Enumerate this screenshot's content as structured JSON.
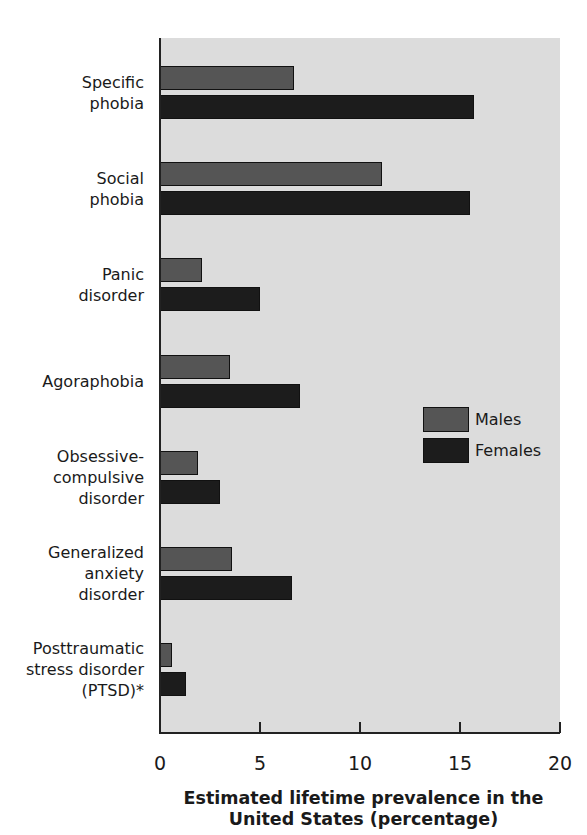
{
  "chart_data": {
    "type": "bar",
    "orientation": "horizontal",
    "title": "",
    "categories": [
      "Specific phobia",
      "Social phobia",
      "Panic disorder",
      "Agoraphobia",
      "Obsessive-compulsive disorder",
      "Generalized anxiety disorder",
      "Posttraumatic stress disorder (PTSD)*"
    ],
    "category_labels": [
      [
        "Specific",
        "phobia"
      ],
      [
        "Social",
        "phobia"
      ],
      [
        "Panic",
        "disorder"
      ],
      [
        "Agoraphobia"
      ],
      [
        "Obsessive-",
        "compulsive",
        "disorder"
      ],
      [
        "Generalized",
        "anxiety",
        "disorder"
      ],
      [
        "Posttraumatic",
        "stress disorder",
        "(PTSD)*"
      ]
    ],
    "series": [
      {
        "name": "Males",
        "color": "#555555",
        "values": [
          6.7,
          11.1,
          2.1,
          3.5,
          1.9,
          3.6,
          0.6
        ]
      },
      {
        "name": "Females",
        "color": "#1c1c1c",
        "values": [
          15.7,
          15.5,
          5.0,
          7.0,
          3.0,
          6.6,
          1.3
        ]
      }
    ],
    "xlabel": "Estimated lifetime prevalence in the United States (percentage)",
    "xlabel_lines": [
      "Estimated lifetime prevalence in the",
      "United States (percentage)"
    ],
    "ylabel": "",
    "xlim": [
      0,
      20
    ],
    "xticks": [
      "0",
      "5",
      "10",
      "15",
      "20"
    ],
    "grid": false,
    "legend_position": "right-center inside plot",
    "background": "#dcdcdc"
  }
}
